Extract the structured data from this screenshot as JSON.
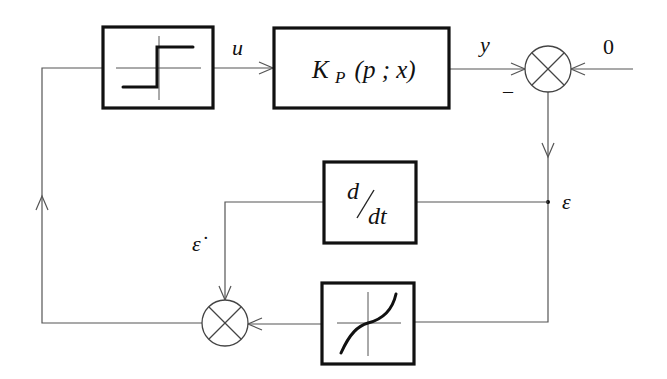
{
  "diagram": {
    "type": "block-diagram",
    "signals": {
      "u": "u",
      "y": "y",
      "reference": "0",
      "error": "ε",
      "error_dot": "ε̇",
      "minus_sign": "–"
    },
    "blocks": {
      "relay": {
        "label": "",
        "kind": "relay/step nonlinearity"
      },
      "plant": {
        "label_main": "K",
        "label_sub": "P",
        "label_args": "(p ; x)"
      },
      "derivative": {
        "numerator": "d",
        "denominator": "dt"
      },
      "nonlinearity": {
        "label": "",
        "kind": "cubic-like odd nonlinearity"
      }
    },
    "summing_junctions": [
      {
        "id": "top-sum",
        "inputs": [
          "y (–)",
          "0"
        ],
        "output": "ε"
      },
      {
        "id": "bottom-sum",
        "inputs": [
          "ε̇",
          "f(ε)"
        ],
        "output": "relay input"
      }
    ]
  }
}
